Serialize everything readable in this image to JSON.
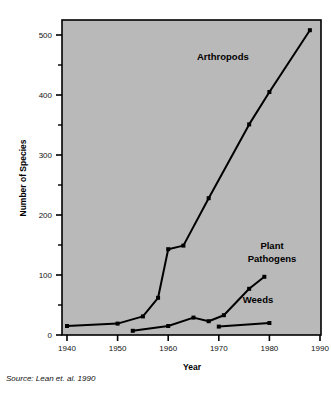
{
  "chart_data": {
    "type": "line",
    "title": "",
    "xlabel": "Year",
    "ylabel": "Number of Species",
    "xlim": [
      1938,
      1990
    ],
    "ylim": [
      0,
      525
    ],
    "grid": false,
    "legend_position": "inline-annotations",
    "x_ticks": [
      1940,
      1950,
      1960,
      1970,
      1980,
      1990
    ],
    "x_tick_labels": [
      "1940",
      "1950",
      "1960",
      "1970",
      "1980",
      "1990"
    ],
    "y_ticks": [
      0,
      100,
      200,
      300,
      400,
      500
    ],
    "y_tick_labels": [
      "0",
      "100",
      "200",
      "300",
      "400",
      "500"
    ],
    "y_minor_ticks": [
      50,
      150,
      250,
      350,
      450
    ],
    "plot_background": "#b9b9b9",
    "line_color": "#000000",
    "marker": "square",
    "series": [
      {
        "name": "Arthropods",
        "label": "Arthropods",
        "points": [
          [
            1940,
            15
          ],
          [
            1950,
            19
          ],
          [
            1955,
            31
          ],
          [
            1958,
            62
          ],
          [
            1960,
            143
          ],
          [
            1963,
            149
          ],
          [
            1968,
            228
          ],
          [
            1976,
            351
          ],
          [
            1980,
            405
          ],
          [
            1988,
            508
          ]
        ]
      },
      {
        "name": "Plant Pathogens",
        "label": "Plant\nPathogens",
        "label_line1": "Plant",
        "label_line2": "Pathogens",
        "points": [
          [
            1953,
            7
          ],
          [
            1960,
            15
          ],
          [
            1965,
            29
          ],
          [
            1968,
            23
          ],
          [
            1971,
            33
          ],
          [
            1976,
            77
          ],
          [
            1979,
            97
          ]
        ]
      },
      {
        "name": "Weeds",
        "label": "Weeds",
        "points": [
          [
            1970,
            14
          ],
          [
            1980,
            20
          ]
        ]
      }
    ]
  },
  "source": {
    "text": "Source: Lean et. al. 1990"
  },
  "axes": {
    "x_title": "Year",
    "y_title": "Number of Species"
  }
}
